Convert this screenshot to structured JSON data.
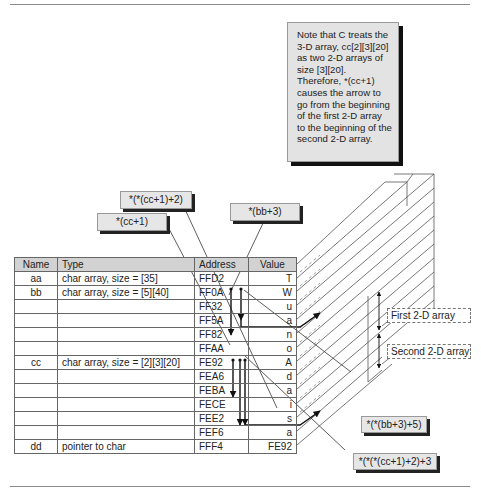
{
  "note": {
    "text": "Note that C treats the 3-D array, cc[2][3][20] as two 2-D arrays of size [3][20].  Therefore, *(cc+1) causes the arrow to go from the beginning of the first 2-D array to the beginning of the second 2-D array."
  },
  "callouts": {
    "cc_plus_1": "*(cc+1)",
    "cc_plus_1_plus_2": "*(*(cc+1)+2)",
    "bb_plus_3": "*(bb+3)",
    "bb_plus_3_plus_5": "*(*(bb+3)+5)",
    "cc_full": "*(*(*(cc+1)+2)+3"
  },
  "region_labels": {
    "first": "First 2-D array",
    "second": "Second 2-D array"
  },
  "table": {
    "headers": {
      "name": "Name",
      "type": "Type",
      "address": "Address",
      "value": "Value"
    },
    "rows": [
      {
        "name": "aa",
        "type": "char array, size = [35]",
        "address": "FFD2",
        "value": "T"
      },
      {
        "name": "bb",
        "type": "char array, size = [5][40]",
        "address": "FF0A",
        "value": "W"
      },
      {
        "name": "",
        "type": "",
        "address": "FF32",
        "value": "u"
      },
      {
        "name": "",
        "type": "",
        "address": "FF5A",
        "value": "a"
      },
      {
        "name": "",
        "type": "",
        "address": "FF82",
        "value": "n"
      },
      {
        "name": "",
        "type": "",
        "address": "FFAA",
        "value": "o"
      },
      {
        "name": "cc",
        "type": "char array,  size = [2][3][20]",
        "address": "FE92",
        "value": "A"
      },
      {
        "name": "",
        "type": "",
        "address": "FEA6",
        "value": "d"
      },
      {
        "name": "",
        "type": "",
        "address": "FEBA",
        "value": "a"
      },
      {
        "name": "",
        "type": "",
        "address": "FECE",
        "value": "i"
      },
      {
        "name": "",
        "type": "",
        "address": "FEE2",
        "value": "s"
      },
      {
        "name": "",
        "type": "",
        "address": "FEF6",
        "value": "a"
      },
      {
        "name": "dd",
        "type": "pointer to char",
        "address": "FFF4",
        "value": "FE92"
      }
    ]
  }
}
